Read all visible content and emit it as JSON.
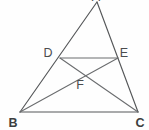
{
  "figure": {
    "background_color": "#fefefe",
    "line_color": "#555759",
    "label_color": "#4a4c4e",
    "width": 149,
    "height": 130,
    "points": [
      {
        "id": "A",
        "label": "A",
        "x": 97,
        "y": 2,
        "label_x": 96,
        "label_y": 1,
        "note": "apex, label clipped at top edge"
      },
      {
        "id": "D",
        "label": "D",
        "x": 60,
        "y": 58,
        "label_x": 48,
        "label_y": 57,
        "note": "on side AB"
      },
      {
        "id": "E",
        "label": "E",
        "x": 118,
        "y": 58,
        "label_x": 123,
        "label_y": 57,
        "note": "on side AC"
      },
      {
        "id": "F",
        "label": "F",
        "x": 80,
        "y": 75,
        "label_x": 80,
        "label_y": 88,
        "note": "intersection of BE and DC"
      },
      {
        "id": "B",
        "label": "B",
        "x": 20,
        "y": 112,
        "label_x": 13,
        "label_y": 126,
        "note": "bottom-left vertex"
      },
      {
        "id": "C",
        "label": "C",
        "x": 138,
        "y": 112,
        "label_x": 139,
        "label_y": 126,
        "note": "bottom-right vertex"
      }
    ],
    "segments": [
      {
        "id": "AB",
        "from": "A",
        "to": "B",
        "name": "side-ab"
      },
      {
        "id": "AC",
        "from": "A",
        "to": "C",
        "name": "side-ac"
      },
      {
        "id": "BC",
        "from": "B",
        "to": "C",
        "name": "side-bc"
      },
      {
        "id": "DE",
        "from": "D",
        "to": "E",
        "name": "segment-de"
      },
      {
        "id": "BE",
        "from": "B",
        "to": "E",
        "name": "cevian-be"
      },
      {
        "id": "DC",
        "from": "D",
        "to": "C",
        "name": "cevian-dc"
      }
    ]
  }
}
